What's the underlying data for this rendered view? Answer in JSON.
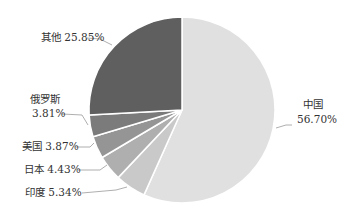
{
  "chart_data": {
    "type": "pie",
    "title": "",
    "start_angle_deg": 0,
    "direction": "clockwise",
    "slices": [
      {
        "label": "中国",
        "value": 56.7,
        "display": "56.70%",
        "color": "#e0e0e0"
      },
      {
        "label": "印度",
        "value": 5.34,
        "display": "5.34%",
        "color": "#c9c9c9"
      },
      {
        "label": "日本",
        "value": 4.43,
        "display": "4.43%",
        "color": "#afafaf"
      },
      {
        "label": "美国",
        "value": 3.87,
        "display": "3.87%",
        "color": "#959595"
      },
      {
        "label": "俄罗斯",
        "value": 3.81,
        "display": "3.81%",
        "color": "#7b7b7b"
      },
      {
        "label": "其他",
        "value": 25.85,
        "display": "25.85%",
        "color": "#5f5f5f"
      }
    ]
  },
  "labels": {
    "china_name": "中国",
    "china_pct": "56.70%",
    "india": "印度 5.34%",
    "japan": "日本 4.43%",
    "usa": "美国 3.87%",
    "russia_name": "俄罗斯",
    "russia_pct": "3.81%",
    "other": "其他 25.85%"
  }
}
